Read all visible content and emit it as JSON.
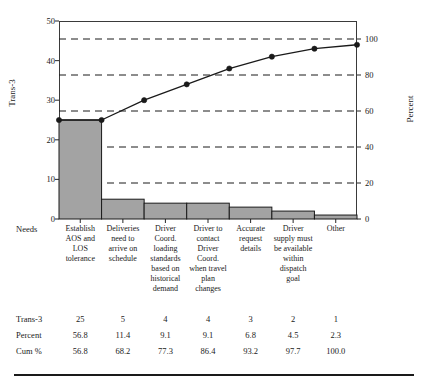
{
  "chart_data": {
    "type": "bar",
    "title": "",
    "xlabel": "Needs",
    "ylabel": "Trans-3",
    "ylabel_right": "Percent",
    "ylim": [
      0,
      50
    ],
    "ylim_right": [
      0,
      110
    ],
    "grid": true,
    "legend": "none",
    "left_ticks": [
      "0",
      "10",
      "20",
      "30",
      "40",
      "50"
    ],
    "left_tick_values": [
      0,
      10,
      20,
      30,
      40,
      50
    ],
    "right_ticks": [
      "0",
      "20",
      "40",
      "60",
      "80",
      "100"
    ],
    "right_tick_values": [
      0,
      20,
      40,
      60,
      80,
      100
    ],
    "categories": [
      "Establish AOS and LOS tolerance",
      "Deliveries need to arrive on schedule",
      "Driver Coord. loading standards based on historical demand",
      "Driver to contact Driver Coord. when travel plan changes",
      "Accurate request details",
      "Driver supply must be available within dispatch goal",
      "Other"
    ],
    "values": [
      25,
      5,
      4,
      4,
      3,
      2,
      1
    ],
    "percent": [
      56.8,
      11.4,
      9.1,
      9.1,
      6.8,
      4.5,
      2.3
    ],
    "cum_percent": [
      56.8,
      68.2,
      77.3,
      86.4,
      93.2,
      97.7,
      100.0
    ],
    "bar_color": "#a3a3a3",
    "line_color": "#1a1a1a"
  },
  "axes": {
    "x_title": "Needs",
    "y_left_title": "Trans-3",
    "y_right_title": "Percent"
  },
  "table": {
    "rows": [
      {
        "label": "Trans-3",
        "cells": [
          "25",
          "5",
          "4",
          "4",
          "3",
          "2",
          "1"
        ]
      },
      {
        "label": "Percent",
        "cells": [
          "56.8",
          "11.4",
          "9.1",
          "9.1",
          "6.8",
          "4.5",
          "2.3"
        ]
      },
      {
        "label": "Cum %",
        "cells": [
          "56.8",
          "68.2",
          "77.3",
          "86.4",
          "93.2",
          "97.7",
          "100.0"
        ]
      }
    ]
  },
  "categories_display": [
    "Establish AOS and LOS tolerance",
    "Deliveries need to arrive on schedule",
    "Driver Coord. loading standards based on historical demand",
    "Driver to contact Driver Coord. when travel plan changes",
    "Accurate request details",
    "Driver supply must be available within dispatch goal",
    "Other"
  ]
}
